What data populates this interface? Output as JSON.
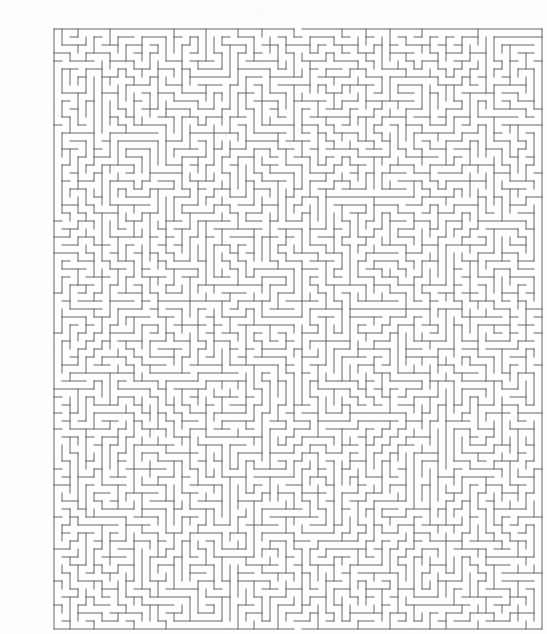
{
  "document": {
    "kind": "maze-puzzle",
    "title": "Maze",
    "background_color": "#fdfdfd",
    "page_width": 522,
    "page_height": 629
  },
  "maze": {
    "name": "rectangular-perfect-maze",
    "wall_color": "#5a5a5a",
    "wall_thickness": 1,
    "cell_size": 8,
    "columns": 61,
    "rows": 75,
    "origin_x": 14,
    "origin_y": 13,
    "width": 488,
    "height": 600,
    "border": {
      "top": true,
      "right": true,
      "bottom": true,
      "left": true
    },
    "entrance": {
      "label": "entrance",
      "edge": "top",
      "column": 30,
      "x": 254,
      "y": 13
    },
    "exit": {
      "label": "exit",
      "edge": "bottom",
      "column": 30,
      "x": 254,
      "y": 613
    },
    "generation": {
      "algorithm": "randomized-depth-first-search",
      "seed": 20240917,
      "perfect": true
    }
  }
}
